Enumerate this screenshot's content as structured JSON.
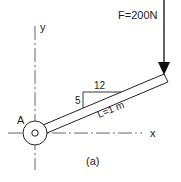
{
  "diagram": {
    "force_label": "F=200N",
    "length_label": "L=1 m",
    "slope_rise": "5",
    "slope_run": "12",
    "point_label": "A",
    "x_axis_label": "x",
    "y_axis_label": "y",
    "caption": "(a)"
  },
  "colors": {
    "stroke": "#222222",
    "background": "#ffffff"
  }
}
